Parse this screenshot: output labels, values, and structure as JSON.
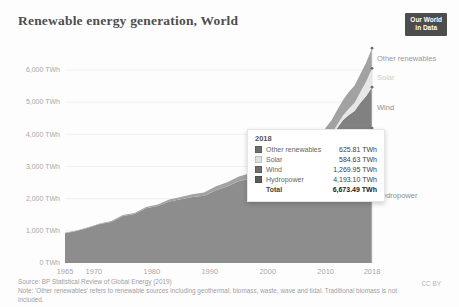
{
  "header": {
    "title": "Renewable energy generation, World",
    "logo": {
      "line1": "Our World",
      "line2": "in Data",
      "bg": "#4d4d4d",
      "fg": "#ffffff"
    }
  },
  "chart_data": {
    "type": "area",
    "stacked": true,
    "title": "Renewable energy generation, World",
    "unit": "TWh",
    "xlim": [
      1965,
      2018
    ],
    "ylim": [
      0,
      6900
    ],
    "grid": true,
    "legend_position": "right-edge-labels",
    "x": [
      1965,
      1967,
      1969,
      1971,
      1973,
      1975,
      1977,
      1979,
      1981,
      1983,
      1985,
      1987,
      1989,
      1991,
      1993,
      1995,
      1997,
      1999,
      2001,
      2003,
      2005,
      2007,
      2009,
      2010,
      2011,
      2012,
      2013,
      2014,
      2015,
      2016,
      2017,
      2018
    ],
    "series": [
      {
        "name": "Hydropower",
        "fill": "#8d8d8d",
        "label_color": "#8f8f8f",
        "values": [
          926,
          994,
          1093,
          1208,
          1278,
          1462,
          1519,
          1699,
          1769,
          1908,
          1979,
          2049,
          2088,
          2257,
          2380,
          2538,
          2620,
          2666,
          2694,
          2692,
          2933,
          3077,
          3252,
          3437,
          3514,
          3672,
          3801,
          3885,
          3890,
          4023,
          4065,
          4193.1
        ]
      },
      {
        "name": "Wind",
        "fill": "#818181",
        "label_color": "#8f8f8f",
        "values": [
          0,
          0,
          0,
          0,
          0,
          0,
          0,
          0,
          0,
          0,
          1,
          2,
          3,
          4,
          6,
          8,
          12,
          21,
          38,
          63,
          104,
          171,
          276,
          342,
          437,
          524,
          646,
          712,
          831,
          959,
          1128,
          1269.95
        ]
      },
      {
        "name": "Solar",
        "fill": "#e7e7e7",
        "label_color": "#cfcfcf",
        "values": [
          0,
          0,
          0,
          0,
          0,
          0,
          0,
          0,
          0,
          0,
          0,
          0,
          0,
          0,
          0,
          0,
          0,
          1,
          1,
          3,
          4,
          7,
          21,
          32,
          65,
          99,
          132,
          198,
          256,
          328,
          443,
          584.63
        ]
      },
      {
        "name": "Other renewables",
        "fill": "#a2a2a2",
        "label_color": "#9a9a9a",
        "values": [
          15,
          17,
          19,
          22,
          26,
          29,
          33,
          39,
          50,
          62,
          74,
          85,
          99,
          112,
          125,
          140,
          155,
          175,
          195,
          222,
          260,
          300,
          350,
          392,
          420,
          455,
          490,
          520,
          540,
          565,
          595,
          625.81
        ]
      }
    ],
    "y_ticks": [
      {
        "value": 0,
        "label": "0 TWh"
      },
      {
        "value": 1000,
        "label": "1,000 TWh"
      },
      {
        "value": 2000,
        "label": "2,000 TWh"
      },
      {
        "value": 3000,
        "label": "3,000 TWh"
      },
      {
        "value": 4000,
        "label": "4,000 TWh"
      },
      {
        "value": 5000,
        "label": "5,000 TWh"
      },
      {
        "value": 6000,
        "label": "6,000 TWh"
      }
    ],
    "x_ticks": [
      {
        "value": 1965,
        "label": "1965"
      },
      {
        "value": 1970,
        "label": "1970"
      },
      {
        "value": 1980,
        "label": "1980"
      },
      {
        "value": 1990,
        "label": "1990"
      },
      {
        "value": 2000,
        "label": "2000"
      },
      {
        "value": 2010,
        "label": "2010"
      },
      {
        "value": 2018,
        "label": "2018"
      }
    ]
  },
  "tooltip": {
    "year": "2018",
    "rows": [
      {
        "label": "Other renewables",
        "value": "625.81 TWh",
        "swatch": "#6f6f6f"
      },
      {
        "label": "Solar",
        "value": "584.63 TWh",
        "swatch": "#e0e0e0"
      },
      {
        "label": "Wind",
        "value": "1,269.95 TWh",
        "swatch": "#6f6f6f"
      },
      {
        "label": "Hydropower",
        "value": "4,193.10 TWh",
        "swatch": "#5c5c5c"
      }
    ],
    "total_label": "Total",
    "total_value": "6,673.49 TWh"
  },
  "footer": {
    "source": "Source: BP Statistical Review of Global Energy (2019)",
    "note": "Note: 'Other renewables' refers to renewable sources including geothermal, biomass, waste, wave and tidal. Traditional biomass is not included.",
    "license": "CC BY"
  },
  "colors": {
    "background": "#fdfdfd",
    "axis_text": "#a8a8a8",
    "gridline": "#ebebeb",
    "hover_line": "#d8d8d8",
    "marker_dot": "#6e6e6e"
  }
}
